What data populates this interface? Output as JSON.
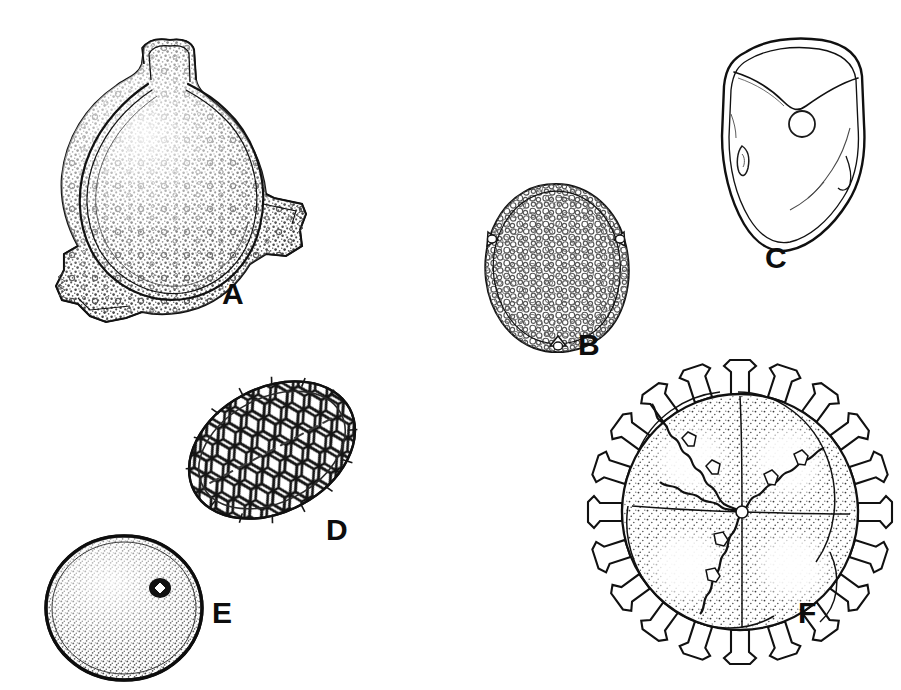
{
  "plate": {
    "title": "Palynological plate of six pollen and spore line drawings",
    "background_color": "#ffffff",
    "ink_color": "#111111",
    "width": 901,
    "height": 690,
    "label_color": "#0d0d0d"
  },
  "figures": [
    {
      "id": "A",
      "label": "A",
      "name": "triradiate-spore-stippled",
      "description": "Large triangular-rounded spore with three blunt protruding arms, dense stippled wall and double-line outline",
      "surface": "scabrate-stippled",
      "label_x": 222,
      "label_y": 295,
      "box": {
        "x": 38,
        "y": 28,
        "w": 266,
        "h": 286
      }
    },
    {
      "id": "B",
      "label": "B",
      "name": "ovoid-reticulate-spore",
      "description": "Egg-shaped spore with fine reticulate surface and three small apertures at the margin",
      "surface": "reticulate-fine",
      "label_x": 578,
      "label_y": 330,
      "box": {
        "x": 464,
        "y": 182,
        "w": 176,
        "h": 164
      }
    },
    {
      "id": "C",
      "label": "C",
      "name": "smooth-triangular-spore",
      "description": "Smooth rounded-triangular spore with double outline, circular pore and small lens-shaped aperture",
      "surface": "psilate-smooth",
      "label_x": 765,
      "label_y": 243,
      "box": {
        "x": 704,
        "y": 34,
        "w": 168,
        "h": 220
      }
    },
    {
      "id": "D",
      "label": "D",
      "name": "ellipsoid-coarse-reticulate-grain",
      "description": "Tilted ellipsoidal grain with coarse polygonal reticulum of thick muri and large lumina",
      "surface": "reticulate-coarse",
      "label_x": 326,
      "label_y": 515,
      "box": {
        "x": 184,
        "y": 368,
        "w": 176,
        "h": 166
      }
    },
    {
      "id": "E",
      "label": "E",
      "name": "spheroidal-porate-spore",
      "description": "Circular spore with dense fine stipple, thick dark rim and a single small pore",
      "surface": "scabrate-stippled",
      "label_x": 212,
      "label_y": 598,
      "box": {
        "x": 36,
        "y": 534,
        "w": 182,
        "h": 148
      }
    },
    {
      "id": "F",
      "label": "F",
      "name": "echinate-spore-tetrad",
      "description": "Spore tetrad with blunt club-shaped echinate spines around the margin and wavy internal suture ridges dividing four lobes",
      "surface": "echinate-spiny",
      "label_x": 798,
      "label_y": 598,
      "box": {
        "x": 598,
        "y": 362,
        "w": 284,
        "h": 300
      }
    }
  ]
}
